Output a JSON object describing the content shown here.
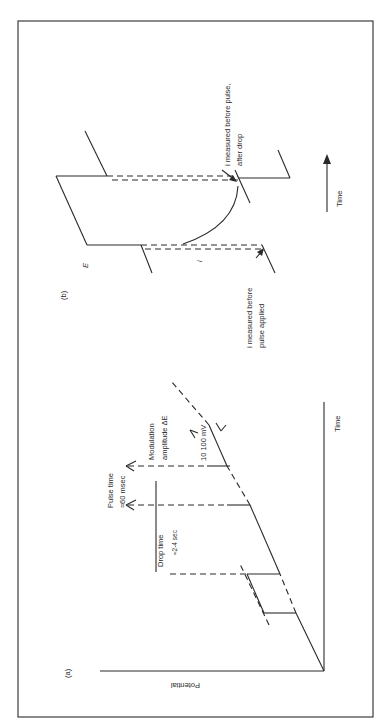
{
  "figure": {
    "orientation": "rotated-90-ccw",
    "panel_a": {
      "label": "(a)",
      "y_axis_label": "Potential",
      "x_axis_label": "Time",
      "annotations": {
        "pulse_time_line1": "Pulse time",
        "pulse_time_line2": "≈60 msec",
        "drop_time_line1": "Drop time",
        "drop_time_line2": "≈2-4 sec",
        "modulation_line1": "Modulation",
        "modulation_line2": "amplitude ΔE",
        "modulation_range": "10 100 mV"
      }
    },
    "panel_b": {
      "label": "(b)",
      "y_axis_label": "E",
      "current_label": "i",
      "time_label": "Time",
      "annotations": {
        "before_pulse_line1": "i measured before",
        "before_pulse_line2": "pulse applied",
        "after_drop_line1": "i measured before pulse,",
        "after_drop_line2": "after drop"
      }
    }
  },
  "colors": {
    "ink": "#2a2a2a",
    "paper": "#ffffff"
  }
}
